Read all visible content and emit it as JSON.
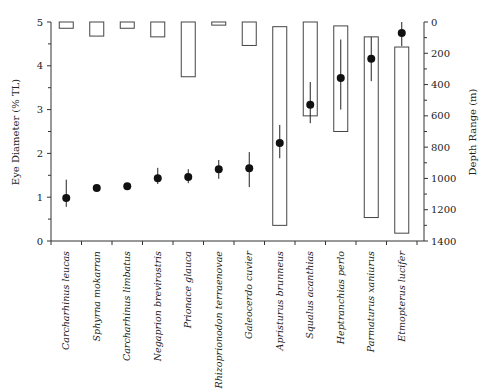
{
  "chart_data": {
    "type": "scatter",
    "title": "",
    "xlabel": "",
    "ylabel": "Eye Diameter (% TL)",
    "y2label": "Depth Range (m)",
    "ylim": [
      0,
      5
    ],
    "y2lim": [
      0,
      1400
    ],
    "y2_inverted": true,
    "grid": false,
    "legend": null,
    "yticks": [
      0,
      1,
      2,
      3,
      4,
      5
    ],
    "yticks_minor": [
      0.5,
      1.5,
      2.5,
      3.5,
      4.5
    ],
    "y2ticks": [
      0,
      200,
      400,
      600,
      800,
      1000,
      1200,
      1400
    ],
    "categories": [
      "Carcharhinus leucas",
      "Sphyrna mokarran",
      "Carcharhinus limbatus",
      "Negaprion brevirostris",
      "Prionace glauca",
      "Rhizoprionodon terraenovae",
      "Galeocerdo cuvier",
      "Apristurus brunneus",
      "Squalus acanthias",
      "Heptranchias perlo",
      "Parmaturus xaniurus",
      "Etmopterus lucifer"
    ],
    "series": [
      {
        "name": "Eye Diameter (% TL)",
        "kind": "point-with-error",
        "axis": "left",
        "values": [
          0.98,
          1.21,
          1.25,
          1.43,
          1.46,
          1.64,
          1.66,
          2.24,
          3.11,
          3.72,
          4.16,
          4.75
        ],
        "err_high": [
          1.4,
          null,
          null,
          1.67,
          1.64,
          1.85,
          2.03,
          2.65,
          3.63,
          4.6,
          4.66,
          5.0
        ],
        "err_low": [
          0.78,
          null,
          null,
          1.3,
          1.32,
          1.42,
          1.23,
          1.89,
          2.69,
          3.0,
          3.65,
          4.45
        ]
      },
      {
        "name": "Depth Range (m)",
        "kind": "floating-bar",
        "axis": "right",
        "min": [
          0,
          0,
          0,
          0,
          0,
          0,
          0,
          30,
          0,
          25,
          95,
          160
        ],
        "max": [
          40,
          90,
          40,
          95,
          350,
          20,
          150,
          1300,
          600,
          700,
          1250,
          1350
        ]
      }
    ]
  }
}
